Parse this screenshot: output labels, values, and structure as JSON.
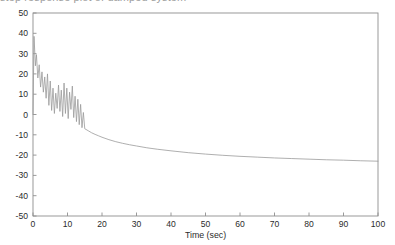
{
  "figure": {
    "background_color": "#ffffff",
    "frame_color": "#8e8e8e",
    "line_color": "#9a9a9a",
    "partial_caption_above": "step response plot of damped system"
  },
  "chart_data": {
    "type": "line",
    "title": "",
    "xlabel": "Time (sec)",
    "ylabel": "",
    "xlim": [
      0,
      100
    ],
    "ylim": [
      -50,
      50
    ],
    "xticks": [
      0,
      10,
      20,
      30,
      40,
      50,
      60,
      70,
      80,
      90,
      100
    ],
    "yticks": [
      -50,
      -40,
      -30,
      -20,
      -10,
      0,
      10,
      20,
      30,
      40,
      50
    ],
    "xtick_labels": [
      "0",
      "10",
      "20",
      "30",
      "40",
      "50",
      "60",
      "70",
      "80",
      "90",
      "100"
    ],
    "ytick_labels": [
      "-50",
      "-40",
      "-30",
      "-20",
      "-10",
      "0",
      "10",
      "20",
      "30",
      "40",
      "50"
    ],
    "grid": false,
    "legend": null,
    "series": [
      {
        "name": "response",
        "color": "#9a9a9a",
        "x": [
          0,
          0.3,
          0.7,
          1.0,
          1.4,
          1.8,
          2.2,
          2.6,
          3.0,
          3.4,
          3.8,
          4.2,
          4.6,
          5.0,
          5.4,
          5.8,
          6.2,
          6.6,
          7.0,
          7.4,
          7.8,
          8.2,
          8.6,
          9.0,
          9.4,
          9.8,
          10.2,
          10.6,
          11.0,
          11.4,
          11.8,
          12.2,
          12.6,
          13.0,
          13.4,
          13.8,
          14.2,
          14.6,
          15.0,
          16,
          17,
          18,
          19,
          20,
          22,
          24,
          26,
          28,
          30,
          33,
          36,
          40,
          45,
          50,
          55,
          60,
          65,
          70,
          75,
          80,
          85,
          90,
          95,
          100
        ],
        "y": [
          0,
          38.5,
          24.0,
          29.5,
          18.0,
          24.5,
          13.5,
          21.0,
          11.0,
          18.5,
          8.0,
          20.0,
          4.5,
          16.5,
          2.0,
          13.0,
          0.5,
          10.5,
          3.0,
          14.5,
          1.5,
          12.0,
          -1.0,
          15.5,
          0.5,
          13.0,
          -2.0,
          11.0,
          2.5,
          14.0,
          -1.5,
          9.0,
          -3.5,
          7.5,
          -5.0,
          5.0,
          -6.5,
          1.0,
          -7.0,
          -8.0,
          -9.0,
          -9.8,
          -10.5,
          -11.2,
          -12.4,
          -13.4,
          -14.2,
          -14.9,
          -15.5,
          -16.4,
          -17.1,
          -17.9,
          -18.8,
          -19.5,
          -20.1,
          -20.6,
          -21.0,
          -21.4,
          -21.7,
          -22.0,
          -22.3,
          -22.5,
          -22.8,
          -23.0
        ]
      }
    ]
  }
}
